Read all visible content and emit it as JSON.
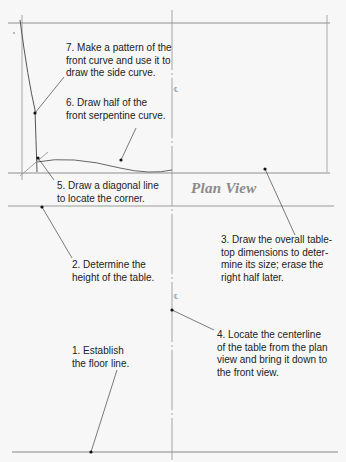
{
  "diagram": {
    "view_title": "Plan View",
    "steps": [
      {
        "number": "1.",
        "text": "1. Establish\nthe floor line."
      },
      {
        "number": "2.",
        "text": "2. Determine the\nheight of the table."
      },
      {
        "number": "3.",
        "text": "3. Draw the overall table-\ntop dimensions to deter-\nmine its size; erase the\nright half later."
      },
      {
        "number": "4.",
        "text": "4. Locate the centerline\nof the table from the plan\nview and bring it down to\nthe front view."
      },
      {
        "number": "5.",
        "text": "5. Draw a diagonal line\nto locate the corner."
      },
      {
        "number": "6.",
        "text": "6. Draw half of the\nfront serpentine curve."
      },
      {
        "number": "7.",
        "text": "7. Make a pattern of the\nfront curve and use it to\ndraw the side curve."
      }
    ],
    "centerline_symbol": "℄",
    "colors": {
      "background": "#f7f7f7",
      "construction_line": "#9a9a9a",
      "leader_line": "#333333",
      "curve_line": "#555555",
      "text": "#222222",
      "title": "#8a8a8a"
    }
  }
}
